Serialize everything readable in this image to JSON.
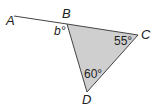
{
  "diagram": {
    "points": {
      "A": {
        "label": "A",
        "x": 14,
        "y": 16
      },
      "B": {
        "label": "B",
        "x": 67,
        "y": 24
      },
      "C": {
        "label": "C",
        "x": 138,
        "y": 35
      },
      "D": {
        "label": "D",
        "x": 87,
        "y": 92
      }
    },
    "angles": {
      "b": "b°",
      "C": "55°",
      "D": "60°"
    },
    "colors": {
      "fill": "#cfcfcf",
      "stroke": "#444444"
    }
  }
}
